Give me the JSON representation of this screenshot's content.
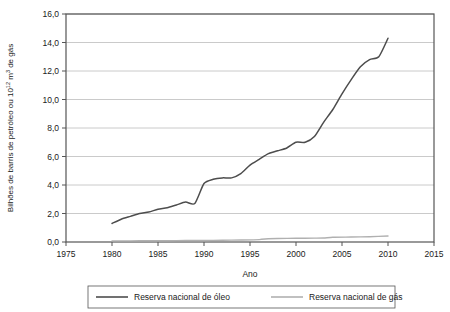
{
  "chart_data": {
    "type": "line",
    "title": "",
    "xlabel": "Ano",
    "ylabel": "Bilhões de barris de petróleo ou 10¹² m³ de gás",
    "ylabel_parts": {
      "pre_sup1": "Bilhões de barris de petróleo ou 10",
      "sup1": "12",
      "mid": " m",
      "sup2": "3",
      "post": " de gás"
    },
    "xlim": [
      1975,
      2015
    ],
    "ylim": [
      0.0,
      16.0
    ],
    "xticks": [
      1975,
      1980,
      1985,
      1990,
      1995,
      2000,
      2005,
      2010,
      2015
    ],
    "xtick_labels": [
      "1975",
      "1980",
      "1985",
      "1990",
      "1995",
      "2000",
      "2005",
      "2010",
      "2015"
    ],
    "yticks": [
      0.0,
      2.0,
      4.0,
      6.0,
      8.0,
      10.0,
      12.0,
      14.0,
      16.0
    ],
    "ytick_labels": [
      "0,0",
      "2,0",
      "4,0",
      "6,0",
      "8,0",
      "10,0",
      "12,0",
      "14,0",
      "16,0"
    ],
    "grid": "horizontal",
    "legend_position": "bottom",
    "series": [
      {
        "name": "Reserva nacional de óleo",
        "color": "#4d4d4d",
        "x": [
          1980,
          1981,
          1982,
          1983,
          1984,
          1985,
          1986,
          1987,
          1988,
          1989,
          1990,
          1991,
          1992,
          1993,
          1994,
          1995,
          1996,
          1997,
          1998,
          1999,
          2000,
          2001,
          2002,
          2003,
          2004,
          2005,
          2006,
          2007,
          2008,
          2009,
          2010
        ],
        "values": [
          1.3,
          1.6,
          1.8,
          2.0,
          2.1,
          2.3,
          2.4,
          2.6,
          2.8,
          2.7,
          4.1,
          4.4,
          4.5,
          4.5,
          4.8,
          5.4,
          5.8,
          6.2,
          6.4,
          6.6,
          7.0,
          7.0,
          7.4,
          8.4,
          9.3,
          10.4,
          11.4,
          12.3,
          12.8,
          13.0,
          14.3
        ]
      },
      {
        "name": "Reserva nacional de gás",
        "color": "#b0b0b0",
        "x": [
          1980,
          1982,
          1984,
          1986,
          1988,
          1990,
          1992,
          1994,
          1996,
          1997,
          1998,
          2000,
          2002,
          2003,
          2004,
          2006,
          2008,
          2010
        ],
        "values": [
          0.08,
          0.08,
          0.09,
          0.09,
          0.1,
          0.11,
          0.12,
          0.14,
          0.17,
          0.23,
          0.25,
          0.26,
          0.27,
          0.28,
          0.33,
          0.35,
          0.37,
          0.42
        ]
      }
    ]
  },
  "legend": {
    "entries": [
      {
        "label": "Reserva nacional de óleo",
        "color": "#4d4d4d"
      },
      {
        "label": "Reserva nacional de gás",
        "color": "#b0b0b0"
      }
    ]
  },
  "colors": {
    "frame": "#555555",
    "grid": "#bdbdbd",
    "oil": "#4d4d4d",
    "gas": "#b0b0b0",
    "text": "#1a1a1a",
    "background": "#ffffff"
  }
}
